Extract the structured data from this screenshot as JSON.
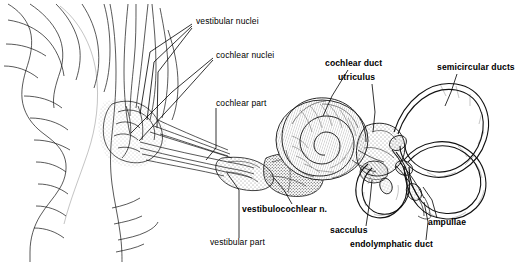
{
  "figure": {
    "background_color": "#ffffff",
    "ink_color": "#000000",
    "width": 520,
    "height": 264
  },
  "labels": [
    {
      "id": "vestibular_nuclei",
      "text": "vestibular nuclei",
      "bold": false,
      "x": 196,
      "y": 22,
      "anchor": "left"
    },
    {
      "id": "cochlear_nuclei",
      "text": "cochlear nuclei",
      "bold": false,
      "x": 216,
      "y": 56,
      "anchor": "left"
    },
    {
      "id": "cochlear_part",
      "text": "cochlear part",
      "bold": false,
      "x": 216,
      "y": 104,
      "anchor": "left"
    },
    {
      "id": "vestibular_part",
      "text": "vestibular part",
      "bold": false,
      "x": 210,
      "y": 243,
      "anchor": "left"
    },
    {
      "id": "vestibulocochlear_n",
      "text": "vestibulocochlear n.",
      "bold": true,
      "x": 242,
      "y": 211,
      "anchor": "left"
    },
    {
      "id": "cochlear_duct",
      "text": "cochlear duct",
      "bold": true,
      "x": 325,
      "y": 64,
      "anchor": "left"
    },
    {
      "id": "utriculus",
      "text": "utriculus",
      "bold": true,
      "x": 338,
      "y": 78,
      "anchor": "left"
    },
    {
      "id": "semicircular_ducts",
      "text": "semicircular ducts",
      "bold": true,
      "x": 437,
      "y": 68,
      "anchor": "left"
    },
    {
      "id": "ampullae",
      "text": "ampullae",
      "bold": true,
      "x": 428,
      "y": 223,
      "anchor": "left"
    },
    {
      "id": "sacculus",
      "text": "sacculus",
      "bold": true,
      "x": 330,
      "y": 231,
      "anchor": "left"
    },
    {
      "id": "endolymphatic_duct",
      "text": "endolymphatic duct",
      "bold": true,
      "x": 350,
      "y": 245,
      "anchor": "left"
    }
  ],
  "leader_lines": [
    {
      "id": "leader-vestibular-nuclei-a",
      "points": "194,22 150,52 141,112"
    },
    {
      "id": "leader-vestibular-nuclei-b",
      "points": "194,24 152,60 148,118"
    },
    {
      "id": "leader-vestibular-nuclei-c",
      "points": "194,26 156,70 158,128"
    },
    {
      "id": "leader-cochlear-nuclei-a",
      "points": "214,58 170,90 132,132"
    },
    {
      "id": "leader-cochlear-nuclei-b",
      "points": "214,60 175,98 140,140"
    },
    {
      "id": "leader-cochlear-part",
      "points": "214,107 214,148 208,160"
    },
    {
      "id": "leader-vestibular-part",
      "points": "238,240 238,190 228,172"
    },
    {
      "id": "leader-vestibulocochlear",
      "points": "290,205 282,188 272,176"
    },
    {
      "id": "leader-cochlear-duct",
      "points": "346,70 330,96 322,116"
    },
    {
      "id": "leader-utriculus",
      "points": "372,84 374,112 372,134"
    },
    {
      "id": "leader-semicircular-ducts",
      "points": "455,74 450,92 444,106"
    },
    {
      "id": "leader-ampullae",
      "points": "437,218 432,200 424,186"
    },
    {
      "id": "leader-sacculus",
      "points": "366,227 370,200 372,178"
    },
    {
      "id": "leader-endolymphatic-duct",
      "points": "426,241 428,222 424,200"
    }
  ]
}
